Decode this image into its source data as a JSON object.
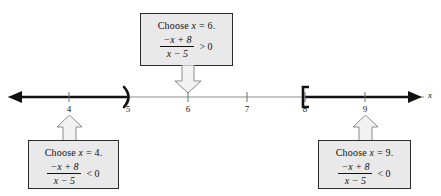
{
  "figure": {
    "type": "number-line-sign-chart",
    "axis_label": "x",
    "tick_labels": [
      "4",
      "5",
      "6",
      "7",
      "8",
      "9"
    ],
    "tick_values": [
      4,
      5,
      6,
      7,
      8,
      9
    ],
    "axis_range": [
      3.3,
      9.9
    ],
    "endpoints": [
      {
        "value": 5,
        "symbol": ")",
        "type": "open"
      },
      {
        "value": 8,
        "symbol": "[",
        "type": "closed"
      }
    ],
    "shaded_rays": [
      {
        "from": "-infinity",
        "to": 5,
        "style": "thick",
        "direction": "left"
      },
      {
        "from": 8,
        "to": "+infinity",
        "style": "thick",
        "direction": "right"
      }
    ],
    "colors": {
      "line": "#111111",
      "thin_line": "#8d8d8d",
      "box_fill": "#e9e9e9",
      "box_border": "#2b2b2b",
      "arrow_fill": "#f2f2f2",
      "arrow_border": "#8a8a8a",
      "text": "#111111"
    }
  },
  "callouts": {
    "top": {
      "headline_prefix": "Choose ",
      "headline_var": "x",
      "headline_value": " = 6.",
      "numerator": "−x + 8",
      "denominator": "x − 5",
      "relation": "> 0",
      "points_to": "6",
      "arrow_direction": "down"
    },
    "bottom_left": {
      "headline_prefix": "Choose ",
      "headline_var": "x",
      "headline_value": " = 4.",
      "numerator": "−x + 8",
      "denominator": "x − 5",
      "relation": "< 0",
      "points_to": "4",
      "arrow_direction": "up"
    },
    "bottom_right": {
      "headline_prefix": "Choose ",
      "headline_var": "x",
      "headline_value": " = 9.",
      "numerator": "−x + 8",
      "denominator": "x − 5",
      "relation": "< 0",
      "points_to": "9",
      "arrow_direction": "up"
    }
  }
}
